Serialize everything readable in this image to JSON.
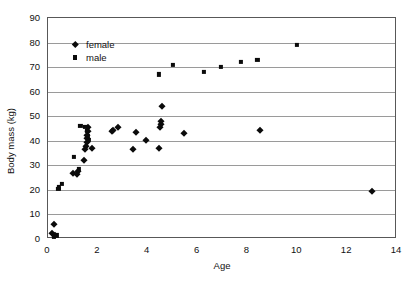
{
  "chart_data": {
    "type": "scatter",
    "title": "",
    "xlabel": "Age",
    "ylabel": "Body mass (kg)",
    "xlim": [
      0,
      14
    ],
    "ylim": [
      0,
      90
    ],
    "xticks": [
      0,
      2,
      4,
      6,
      8,
      10,
      12,
      14
    ],
    "yticks": [
      0,
      10,
      20,
      30,
      40,
      50,
      60,
      70,
      80,
      90
    ],
    "grid": "horizontal",
    "legend_position": "upper-left-inside",
    "series": [
      {
        "name": "female",
        "marker": "diamond",
        "color": "#0b0b0b",
        "points": [
          [
            0.15,
            2.5
          ],
          [
            0.25,
            6.0
          ],
          [
            0.3,
            1.5
          ],
          [
            1.0,
            27.0
          ],
          [
            1.15,
            26.5
          ],
          [
            1.2,
            27.5
          ],
          [
            1.45,
            32.0
          ],
          [
            1.5,
            36.5
          ],
          [
            1.52,
            38.0
          ],
          [
            1.55,
            39.5
          ],
          [
            1.55,
            41.0
          ],
          [
            1.58,
            42.5
          ],
          [
            1.6,
            44.0
          ],
          [
            1.62,
            45.5
          ],
          [
            1.75,
            37.0
          ],
          [
            2.55,
            44.0
          ],
          [
            2.62,
            44.5
          ],
          [
            2.8,
            45.5
          ],
          [
            3.4,
            36.5
          ],
          [
            3.55,
            43.5
          ],
          [
            3.95,
            40.5
          ],
          [
            4.45,
            37.0
          ],
          [
            4.5,
            45.5
          ],
          [
            4.55,
            47.0
          ],
          [
            4.55,
            48.0
          ],
          [
            4.58,
            54.0
          ],
          [
            5.45,
            43.0
          ],
          [
            8.5,
            44.5
          ],
          [
            13.0,
            19.5
          ]
        ]
      },
      {
        "name": "male",
        "marker": "square",
        "color": "#0b0b0b",
        "points": [
          [
            0.25,
            1.0
          ],
          [
            0.35,
            1.5
          ],
          [
            0.42,
            20.5
          ],
          [
            0.45,
            21.0
          ],
          [
            0.55,
            22.5
          ],
          [
            1.05,
            33.5
          ],
          [
            1.25,
            28.5
          ],
          [
            1.5,
            45.5
          ],
          [
            1.55,
            44.0
          ],
          [
            1.6,
            42.0
          ],
          [
            1.62,
            40.5
          ],
          [
            1.3,
            46.0
          ],
          [
            4.45,
            67.0
          ],
          [
            5.0,
            71.0
          ],
          [
            6.25,
            68.0
          ],
          [
            6.95,
            70.0
          ],
          [
            7.75,
            72.0
          ],
          [
            8.4,
            73.0
          ],
          [
            10.0,
            79.0
          ]
        ]
      }
    ]
  },
  "legend": {
    "items": [
      {
        "label": "female",
        "marker": "diamond"
      },
      {
        "label": "male",
        "marker": "square"
      }
    ]
  }
}
